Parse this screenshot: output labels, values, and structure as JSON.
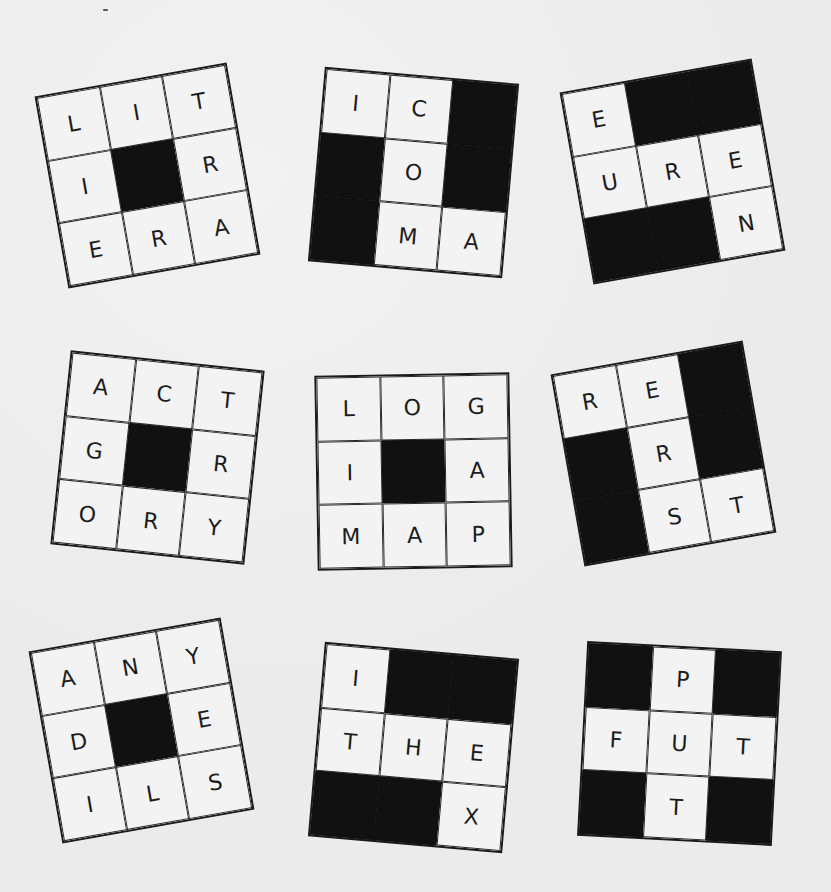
{
  "puzzle": {
    "colors": {
      "background": "#ebebeb",
      "cell": "#f3f3f3",
      "block": "#111111",
      "ink": "#1c1c1c"
    },
    "grids": [
      {
        "id": "grid-1",
        "rotation_deg": -10,
        "cells": [
          "L",
          "I",
          "T",
          "I",
          "#",
          "R",
          "E",
          "R",
          "A"
        ]
      },
      {
        "id": "grid-2",
        "rotation_deg": 5,
        "cells": [
          "I",
          "C",
          "#",
          "#",
          "O",
          "#",
          "#",
          "M",
          "A"
        ]
      },
      {
        "id": "grid-3",
        "rotation_deg": -10,
        "cells": [
          "E",
          "#",
          "#",
          "U",
          "R",
          "E",
          "#",
          "#",
          "N"
        ]
      },
      {
        "id": "grid-4",
        "rotation_deg": 6,
        "cells": [
          "A",
          "C",
          "T",
          "G",
          "#",
          "R",
          "O",
          "R",
          "Y"
        ]
      },
      {
        "id": "grid-5",
        "rotation_deg": -1,
        "cells": [
          "L",
          "O",
          "G",
          "I",
          "#",
          "A",
          "M",
          "A",
          "P"
        ]
      },
      {
        "id": "grid-6",
        "rotation_deg": -10,
        "cells": [
          "R",
          "E",
          "#",
          "#",
          "R",
          "#",
          "#",
          "S",
          "T"
        ]
      },
      {
        "id": "grid-7",
        "rotation_deg": -10,
        "cells": [
          "A",
          "N",
          "Y",
          "D",
          "#",
          "E",
          "I",
          "L",
          "S"
        ]
      },
      {
        "id": "grid-8",
        "rotation_deg": 5,
        "cells": [
          "I",
          "#",
          "#",
          "T",
          "H",
          "E",
          "#",
          "#",
          "X"
        ]
      },
      {
        "id": "grid-9",
        "rotation_deg": 3,
        "cells": [
          "#",
          "P",
          "#",
          "F",
          "U",
          "T",
          "#",
          "T",
          "#"
        ]
      }
    ]
  }
}
